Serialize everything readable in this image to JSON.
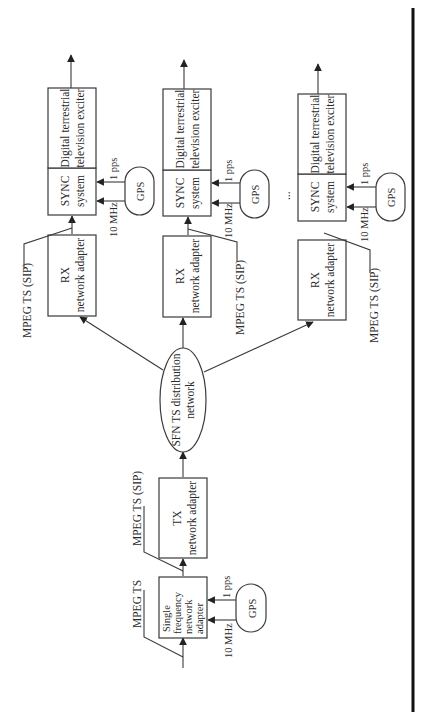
{
  "diagram": {
    "orientation": "rotated-90-ccw",
    "nodes": {
      "input_label": "MPEG TS",
      "sfn_adapter": [
        "Single",
        "frequency",
        "network",
        "adapter"
      ],
      "tx_adapter": {
        "line1": "TX",
        "line2": "network adapter"
      },
      "tx_output_label": "MPEG TS (SIP)",
      "distribution": {
        "line1": "SFN TS distribution",
        "line2": "network"
      },
      "gps": "GPS",
      "ref_10mhz": "10 MHz",
      "ref_1pps": "1 pps",
      "ellipsis": "..."
    },
    "receivers": [
      {
        "rx": {
          "line1": "RX",
          "line2": "network adapter"
        },
        "rx_output_label": "MPEG TS (SIP)",
        "sync": {
          "line1": "SYNC",
          "line2": "system"
        },
        "exciter": {
          "line1": "Digital terrestrial",
          "line2": "television exciter"
        },
        "gps": "GPS",
        "ref_10mhz": "10 MHz",
        "ref_1pps": "1 pps"
      },
      {
        "rx": {
          "line1": "RX",
          "line2": "network adapter"
        },
        "rx_output_label": "MPEG TS (SIP)",
        "sync": {
          "line1": "SYNC",
          "line2": "system"
        },
        "exciter": {
          "line1": "Digital terrestrial",
          "line2": "television exciter"
        },
        "gps": "GPS",
        "ref_10mhz": "10 MHz",
        "ref_1pps": "1 pps"
      },
      {
        "rx": {
          "line1": "RX",
          "line2": "network adapter"
        },
        "rx_output_label": "MPEG TS (SIP)",
        "sync": {
          "line1": "SYNC",
          "line2": "system"
        },
        "exciter": {
          "line1": "Digital terrestrial",
          "line2": "television exciter"
        },
        "gps": "GPS",
        "ref_10mhz": "10 MHz",
        "ref_1pps": "1 pps"
      }
    ]
  }
}
